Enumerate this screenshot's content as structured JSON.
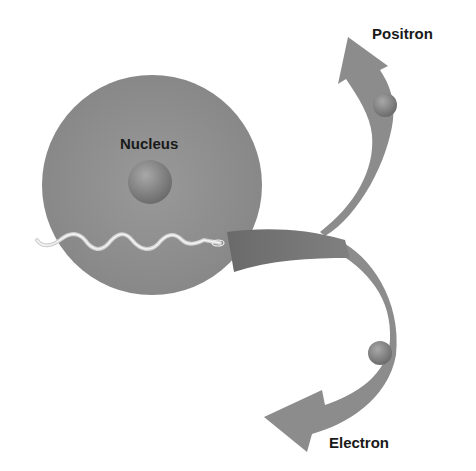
{
  "diagram": {
    "labels": {
      "nucleus": "Nucleus",
      "positron": "Positron",
      "electron": "Electron"
    },
    "elements": {
      "nucleus_circle": {
        "cx": 152,
        "cy": 185,
        "r": 110,
        "color": "#8a8a8a"
      },
      "core_particle": {
        "cx": 150,
        "cy": 182,
        "r": 22,
        "color": "#7e7e7e"
      },
      "photon_wave": {
        "from": [
          36,
          243
        ],
        "to": [
          225,
          243
        ],
        "color": "#e8e8e8"
      },
      "incoming_arrow_band": {
        "color": "#6f6f6f"
      },
      "positron_arrow": {
        "direction": "up",
        "color": "#8a8a8a",
        "particle_color": "#9a9a9a"
      },
      "electron_arrow": {
        "direction": "down-left",
        "color": "#8a8a8a",
        "particle_color": "#9a9a9a"
      }
    }
  }
}
